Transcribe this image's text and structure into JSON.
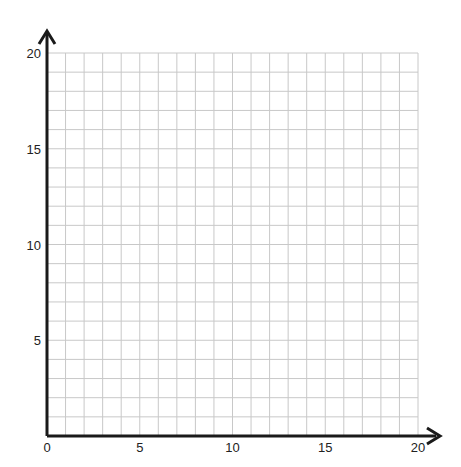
{
  "chart_data": {
    "type": "scatter",
    "title": "",
    "xlabel": "",
    "ylabel": "",
    "xlim": [
      0,
      20
    ],
    "ylim": [
      0,
      20
    ],
    "grid": true,
    "grid_step": 1,
    "x_ticks": [
      "0",
      "5",
      "10",
      "15",
      "20"
    ],
    "y_ticks": [
      "5",
      "10",
      "15",
      "20"
    ],
    "series": [],
    "note": "Blank first-quadrant coordinate grid with arrowed axes"
  },
  "colors": {
    "grid": "#c8c8c8",
    "axis": "#1a1a1a",
    "label": "#222222"
  }
}
